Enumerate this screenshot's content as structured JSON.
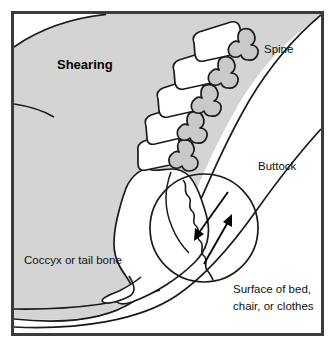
{
  "figure": {
    "border_color": "#3b3b3b",
    "background_color": "#ffffff",
    "body_fill_color": "#d4d4d4",
    "outline_color": "#1a1a1a",
    "bone_fill_color": "#ffffff",
    "process_fill_color": "#c9c9c9",
    "arrow_color": "#000000"
  },
  "labels": {
    "shearing": "Shearing",
    "spine": "Spine",
    "buttock": "Buttock",
    "coccyx": "Coccyx or tail bone",
    "surface_line1": "Surface of bed,",
    "surface_line2": "chair, or clothes"
  },
  "anatomy": {
    "vertebrae_count": 5,
    "sacrum_label": "sacrum-coccyx",
    "detail_circle_label": "shear-detail-circle",
    "arrows": [
      {
        "name": "shear-arrow-down-left",
        "direction": "down-left"
      },
      {
        "name": "shear-arrow-up-right",
        "direction": "up-right"
      }
    ]
  }
}
